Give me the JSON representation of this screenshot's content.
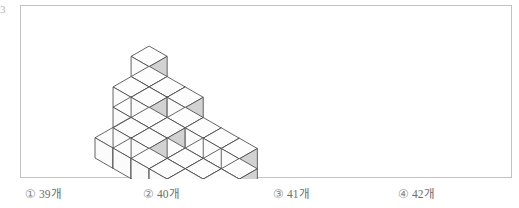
{
  "edge_mark": "3",
  "figure": {
    "cube_size": 22,
    "origin": {
      "x": 74,
      "y": 152
    },
    "faces": {
      "top_color": "#fdfdfd",
      "left_color": "#fbfbfb",
      "right_color": "#d2d2d2",
      "stroke_color": "#4a4a4a"
    },
    "columns": [
      {
        "col": 0,
        "row": 0,
        "height": 1
      },
      {
        "col": 0,
        "row": 1,
        "height": 3
      },
      {
        "col": 0,
        "row": 2,
        "height": 4
      },
      {
        "col": 1,
        "row": 0,
        "height": 2
      },
      {
        "col": 1,
        "row": 1,
        "height": 3
      },
      {
        "col": 1,
        "row": 2,
        "height": 3
      },
      {
        "col": 2,
        "row": 0,
        "height": 2
      },
      {
        "col": 2,
        "row": 1,
        "height": 2
      },
      {
        "col": 2,
        "row": 2,
        "height": 3
      },
      {
        "col": 3,
        "row": 0,
        "height": 1
      },
      {
        "col": 3,
        "row": 1,
        "height": 1
      },
      {
        "col": 3,
        "row": 2,
        "height": 2
      },
      {
        "col": 4,
        "row": 0,
        "height": 1
      },
      {
        "col": 4,
        "row": 1,
        "height": 1
      },
      {
        "col": 4,
        "row": 2,
        "height": 2
      },
      {
        "col": 5,
        "row": 0,
        "height": 1
      },
      {
        "col": 5,
        "row": 1,
        "height": 1
      },
      {
        "col": 5,
        "row": 2,
        "height": 2
      }
    ]
  },
  "options": [
    {
      "num": "①",
      "label": "39개"
    },
    {
      "num": "②",
      "label": "40개"
    },
    {
      "num": "③",
      "label": "41개"
    },
    {
      "num": "④",
      "label": "42개"
    }
  ]
}
